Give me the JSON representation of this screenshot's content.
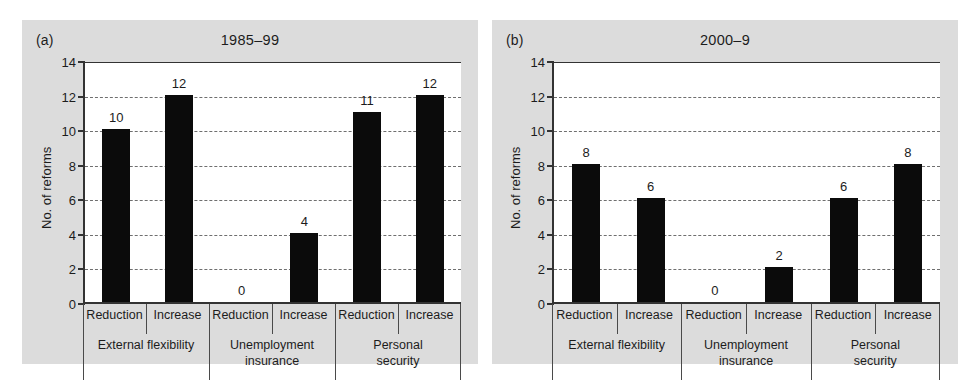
{
  "figure": {
    "background": "#ffffff",
    "panel_background": "#dcdcdc",
    "bar_color": "#0b0b0b",
    "axis_color": "#333333"
  },
  "panels": [
    {
      "tag": "(a)",
      "title": "1985–99",
      "ylabel": "No. of reforms",
      "yticks": [
        "0",
        "2",
        "4",
        "6",
        "8",
        "10",
        "12",
        "14"
      ],
      "groups": [
        {
          "label": "External flexibility",
          "bars": [
            {
              "sub": "Reduction",
              "value": 10,
              "value_label": "10"
            },
            {
              "sub": "Increase",
              "value": 12,
              "value_label": "12"
            }
          ]
        },
        {
          "label": "Unemployment\ninsurance",
          "bars": [
            {
              "sub": "Reduction",
              "value": 0,
              "value_label": "0"
            },
            {
              "sub": "Increase",
              "value": 4,
              "value_label": "4"
            }
          ]
        },
        {
          "label": "Personal security",
          "bars": [
            {
              "sub": "Reduction",
              "value": 11,
              "value_label": "11"
            },
            {
              "sub": "Increase",
              "value": 12,
              "value_label": "12"
            }
          ]
        }
      ]
    },
    {
      "tag": "(b)",
      "title": "2000–9",
      "ylabel": "No. of reforms",
      "yticks": [
        "0",
        "2",
        "4",
        "6",
        "8",
        "10",
        "12",
        "14"
      ],
      "groups": [
        {
          "label": "External flexibility",
          "bars": [
            {
              "sub": "Reduction",
              "value": 8,
              "value_label": "8"
            },
            {
              "sub": "Increase",
              "value": 6,
              "value_label": "6"
            }
          ]
        },
        {
          "label": "Unemployment\ninsurance",
          "bars": [
            {
              "sub": "Reduction",
              "value": 0,
              "value_label": "0"
            },
            {
              "sub": "Increase",
              "value": 2,
              "value_label": "2"
            }
          ]
        },
        {
          "label": "Personal security",
          "bars": [
            {
              "sub": "Reduction",
              "value": 6,
              "value_label": "6"
            },
            {
              "sub": "Increase",
              "value": 8,
              "value_label": "8"
            }
          ]
        }
      ]
    }
  ],
  "chart_data": [
    {
      "type": "bar",
      "title": "1985–99",
      "panel": "(a)",
      "xlabel": "",
      "ylabel": "No. of reforms",
      "ylim": [
        0,
        14
      ],
      "ytick_step": 2,
      "grid": true,
      "grid_axis": "y",
      "legend": "none",
      "categories": [
        "External flexibility – Reduction",
        "External flexibility – Increase",
        "Unemployment insurance – Reduction",
        "Unemployment insurance – Increase",
        "Personal security – Reduction",
        "Personal security – Increase"
      ],
      "values": [
        10,
        12,
        0,
        4,
        11,
        12
      ],
      "data_labels": [
        "10",
        "12",
        "0",
        "4",
        "11",
        "12"
      ],
      "groups": [
        "External flexibility",
        "Unemployment insurance",
        "Personal security"
      ],
      "subcategories": [
        "Reduction",
        "Increase"
      ],
      "bar_color": "#0b0b0b"
    },
    {
      "type": "bar",
      "title": "2000–9",
      "panel": "(b)",
      "xlabel": "",
      "ylabel": "No. of reforms",
      "ylim": [
        0,
        14
      ],
      "ytick_step": 2,
      "grid": true,
      "grid_axis": "y",
      "legend": "none",
      "categories": [
        "External flexibility – Reduction",
        "External flexibility – Increase",
        "Unemployment insurance – Reduction",
        "Unemployment insurance – Increase",
        "Personal security – Reduction",
        "Personal security – Increase"
      ],
      "values": [
        8,
        6,
        0,
        2,
        6,
        8
      ],
      "data_labels": [
        "8",
        "6",
        "0",
        "2",
        "6",
        "8"
      ],
      "groups": [
        "External flexibility",
        "Unemployment insurance",
        "Personal security"
      ],
      "subcategories": [
        "Reduction",
        "Increase"
      ],
      "bar_color": "#0b0b0b"
    }
  ]
}
